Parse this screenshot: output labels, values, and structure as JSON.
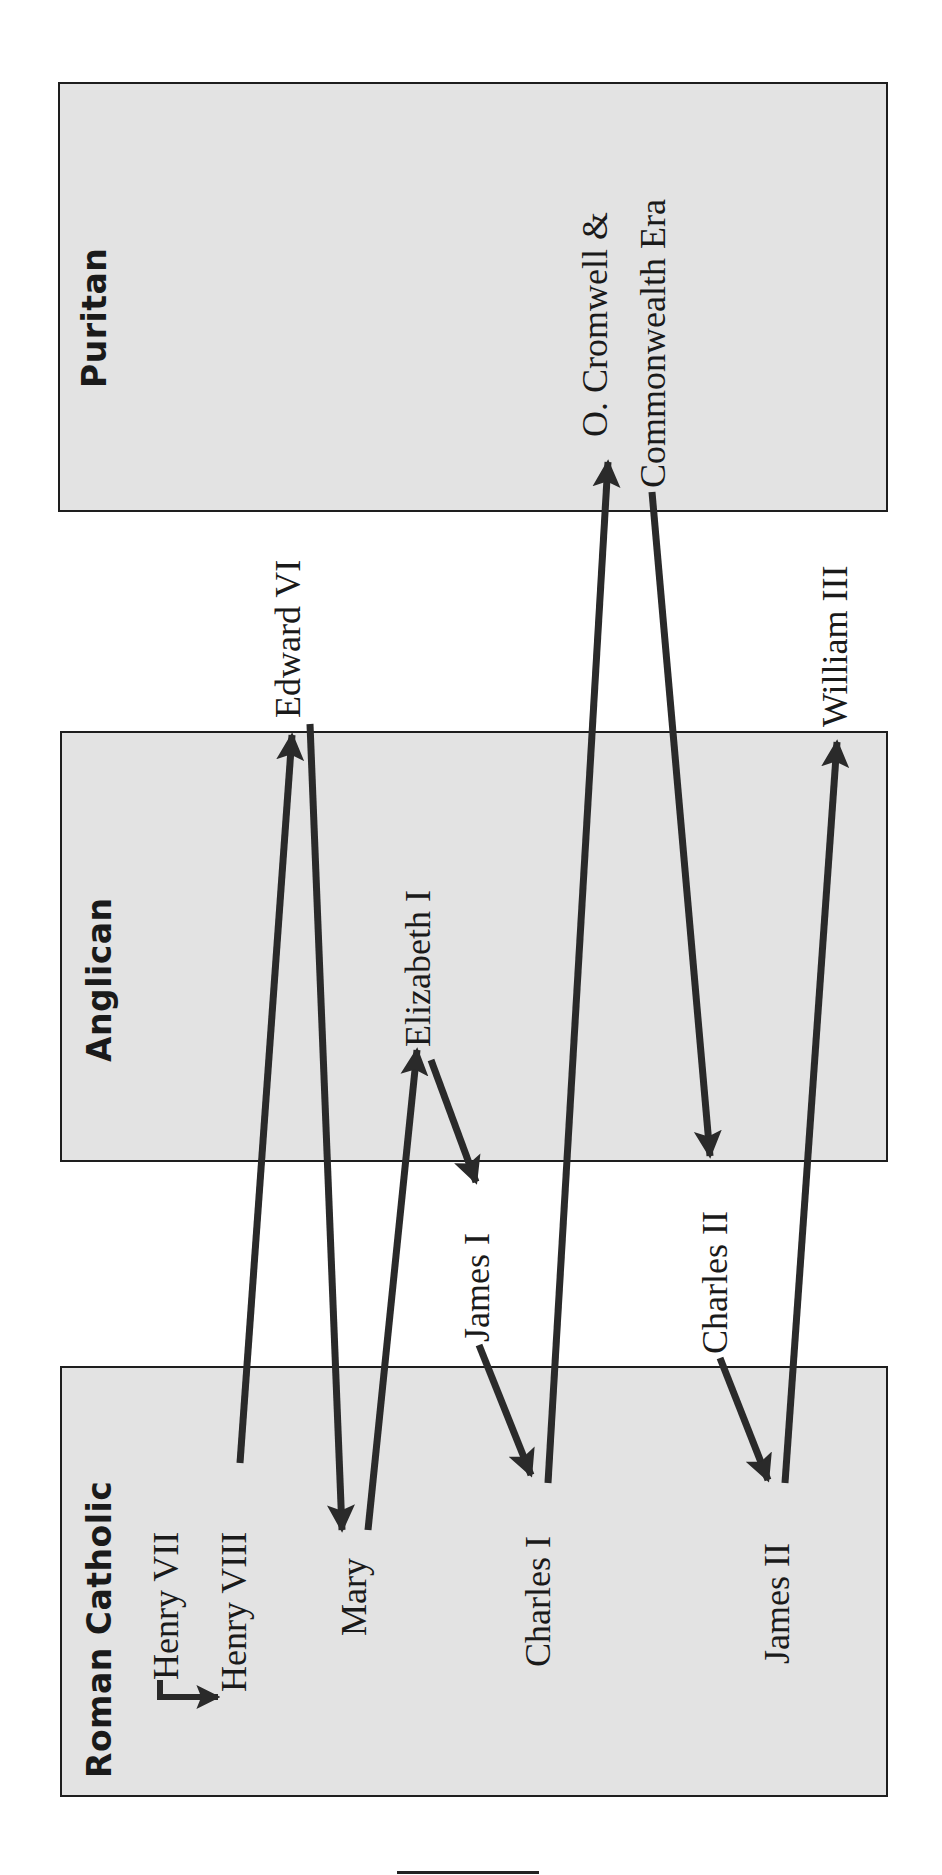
{
  "diagram": {
    "type": "religious-succession-flow",
    "orientation": "rotated-90-ccw",
    "line_color": "#2a2a2a",
    "box_fill": "#e3e3e3",
    "columns": [
      {
        "id": "roman_catholic",
        "label": "Roman Catholic"
      },
      {
        "id": "anglican",
        "label": "Anglican"
      },
      {
        "id": "puritan",
        "label": "Puritan"
      }
    ],
    "monarchs": {
      "henry_vii": "Henry VII",
      "henry_viii": "Henry VIII",
      "edward_vi": "Edward VI",
      "mary": "Mary",
      "elizabeth_i": "Elizabeth I",
      "james_i": "James I",
      "charles_i": "Charles I",
      "cromwell_line1": "O. Cromwell &",
      "cromwell_line2": "Commonwealth Era",
      "charles_ii": "Charles II",
      "james_ii": "James II",
      "william_iii": "William III"
    },
    "transitions": [
      {
        "from": "Henry VII",
        "to": "Henry VIII",
        "from_group": "Roman Catholic",
        "to_group": "Roman Catholic"
      },
      {
        "from": "Henry VIII",
        "to": "Edward VI",
        "from_group": "Roman Catholic",
        "to_group": "Anglican"
      },
      {
        "from": "Edward VI",
        "to": "Mary",
        "from_group": "Anglican",
        "to_group": "Roman Catholic"
      },
      {
        "from": "Mary",
        "to": "Elizabeth I",
        "from_group": "Roman Catholic",
        "to_group": "Anglican"
      },
      {
        "from": "Elizabeth I",
        "to": "James I",
        "from_group": "Anglican",
        "to_group": "Between"
      },
      {
        "from": "James I",
        "to": "Charles I",
        "from_group": "Between",
        "to_group": "Roman Catholic"
      },
      {
        "from": "Charles I",
        "to": "O. Cromwell & Commonwealth Era",
        "from_group": "Roman Catholic",
        "to_group": "Puritan"
      },
      {
        "from": "O. Cromwell & Commonwealth Era",
        "to": "Charles II",
        "from_group": "Puritan",
        "to_group": "Between"
      },
      {
        "from": "Charles II",
        "to": "James II",
        "from_group": "Between",
        "to_group": "Roman Catholic"
      },
      {
        "from": "James II",
        "to": "William III",
        "from_group": "Roman Catholic",
        "to_group": "Anglican"
      }
    ]
  }
}
